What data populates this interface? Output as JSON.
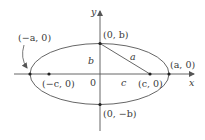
{
  "diagram": {
    "type": "ellipse-with-foci",
    "colors": {
      "stroke": "#555555",
      "text": "#3a3a3a",
      "background": "#ffffff"
    },
    "axes": {
      "x_label": "x",
      "y_label": "y",
      "origin_label": "0"
    },
    "points": {
      "left_vertex": "(−a, 0)",
      "right_vertex": "(a, 0)",
      "top_vertex": "(0, b)",
      "bottom_vertex": "(0, −b)",
      "left_focus": "(−c, 0)",
      "right_focus": "(c, 0)"
    },
    "segments": {
      "a": "a",
      "b": "b",
      "c": "c"
    }
  }
}
